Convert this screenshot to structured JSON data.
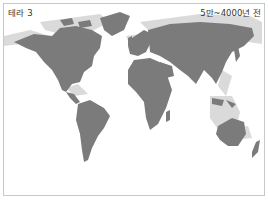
{
  "map": {
    "title": "테라 3",
    "period": "5만~4000년 전",
    "colors": {
      "background": "#ffffff",
      "land": "#7b7b7b",
      "exposed_shelf": "#dadada",
      "border": "#c8c8c8"
    },
    "legend_semantics": {
      "dark_gray": "present-day land",
      "light_gray": "land exposed during lower sea level"
    }
  }
}
